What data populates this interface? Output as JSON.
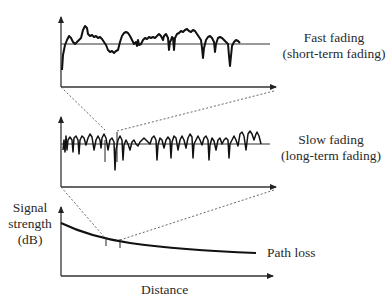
{
  "diagram": {
    "panels": [
      {
        "id": "fast",
        "label_line1": "Fast fading",
        "label_line2": "(short-term fading)"
      },
      {
        "id": "slow",
        "label_line1": "Slow fading",
        "label_line2": "(long-term fading)"
      },
      {
        "id": "pathloss",
        "label_line1": "Path loss"
      }
    ],
    "y_axis_label": {
      "line1": "Signal",
      "line2": "strength",
      "line3": "(dB)"
    },
    "x_axis_label": "Distance",
    "colors": {
      "stroke": "#111111",
      "axis": "#333333",
      "dotted": "#555555",
      "text": "#2a2a2a"
    }
  }
}
